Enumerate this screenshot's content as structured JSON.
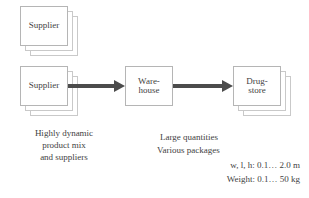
{
  "diagram": {
    "colors": {
      "box_border": "#b5b5b5",
      "stack_border": "#c9c9c9",
      "arrow": "#4c4c4c",
      "text": "#3f3f3f",
      "background": "#ffffff"
    },
    "nodes": [
      {
        "id": "supplier-top",
        "label": "Supplier",
        "stacked": true,
        "stack_count": 3
      },
      {
        "id": "supplier-bottom",
        "label": "Supplier",
        "stacked": true,
        "stack_count": 3
      },
      {
        "id": "warehouse",
        "label": "Ware-\nhouse",
        "stacked": false,
        "stack_count": 1
      },
      {
        "id": "drugstore",
        "label": "Drug-\nstore",
        "stacked": true,
        "stack_count": 3
      }
    ],
    "arrows": [
      {
        "id": "supplier-to-warehouse",
        "from": "supplier-bottom",
        "to": "warehouse"
      },
      {
        "id": "warehouse-to-drugstore",
        "from": "warehouse",
        "to": "drugstore"
      }
    ],
    "captions": {
      "supplier_note": "Highly dynamic\nproduct mix\nand suppliers",
      "flow_note_line1": "Large quantities",
      "flow_note_line2": "Various packages",
      "flow_note_line3": "w, l, h: 0.1… 2.0 m",
      "flow_note_line4": "Weight: 0.1… 50 kg"
    }
  }
}
